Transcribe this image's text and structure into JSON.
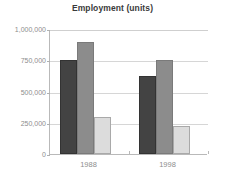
{
  "chart_data": {
    "type": "bar",
    "title": "Employment (units)",
    "xlabel": "",
    "ylabel": "",
    "categories": [
      "1988",
      "1998"
    ],
    "series": [
      {
        "name": "series-1",
        "color": "#434343",
        "values": [
          750000,
          625000
        ]
      },
      {
        "name": "series-2",
        "color": "#8c8c8c",
        "values": [
          900000,
          750000
        ]
      },
      {
        "name": "series-3",
        "color": "#dcdcdc",
        "values": [
          300000,
          225000
        ]
      }
    ],
    "ylim": [
      0,
      1000000
    ],
    "ytick_values": [
      0,
      250000,
      500000,
      750000,
      1000000
    ],
    "ytick_labels": [
      "0",
      "250,000",
      "500,000",
      "750,000",
      "1,000,000"
    ],
    "grid": true,
    "legend": false,
    "legend_position": "none"
  },
  "colors": {
    "background": "#ffffff",
    "title_text": "#3a3a3a",
    "tick_text": "#8d8d8d",
    "gridline": "#d6d6d6",
    "axis_line": "#b9b9b9"
  }
}
